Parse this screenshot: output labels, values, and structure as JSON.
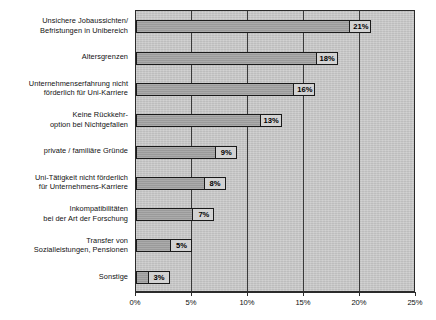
{
  "chart_data": {
    "type": "bar",
    "orientation": "horizontal",
    "title": "",
    "subtitle": "",
    "xlabel": "",
    "ylabel": "",
    "xlim": [
      0,
      25
    ],
    "grid": true,
    "legend": false,
    "legend_position": "none",
    "value_suffix": "%",
    "categories": [
      "Unsichere Jobaussichten/\nBefristungen in Unibereich",
      "Altersgrenzen",
      "Unternehmenserfahrung nicht\nförderlich für Uni-Karriere",
      "Keine Rückkehr-\noption bei Nichtgefallen",
      "private / familiäre Gründe",
      "Uni-Tätigkeit nicht förderlich\nfür Unternehmens-Karriere",
      "Inkompatibilitäten\nbei der Art der Forschung",
      "Transfer von\nSozialleistungen, Pensionen",
      "Sonstige"
    ],
    "values": [
      21,
      18,
      16,
      13,
      9,
      8,
      7,
      5,
      3
    ],
    "data_labels": [
      "21%",
      "18%",
      "16%",
      "13%",
      "9%",
      "8%",
      "7%",
      "5%",
      "3%"
    ],
    "xticks": [
      0,
      5,
      10,
      15,
      20,
      25
    ],
    "xtick_labels": [
      "0%",
      "5%",
      "10%",
      "15%",
      "20%",
      "25%"
    ],
    "colors": {
      "bar_fill": "#a2a2a2",
      "bar_border": "#1a1a1a",
      "plot_background": "#c9c9c9",
      "grid": "#3a3a3a",
      "axis": "#2b2b2b",
      "label_background": "#d2d2d2",
      "text": "#111111"
    }
  },
  "category_lines": [
    [
      "Unsichere Jobaussichten/",
      "Befristungen in Unibereich"
    ],
    [
      "Altersgrenzen"
    ],
    [
      "Unternehmenserfahrung nicht",
      "förderlich für Uni-Karriere"
    ],
    [
      "Keine Rückkehr-",
      "option bei Nichtgefallen"
    ],
    [
      "private / familiäre Gründe"
    ],
    [
      "Uni-Tätigkeit nicht förderlich",
      "für Unternehmens-Karriere"
    ],
    [
      "Inkompatibilitäten",
      "bei der Art der Forschung"
    ],
    [
      "Transfer von",
      "Sozialleistungen, Pensionen"
    ],
    [
      "Sonstige"
    ]
  ]
}
